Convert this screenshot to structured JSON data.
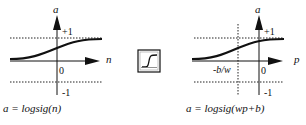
{
  "left_plot": {
    "y_label": "a",
    "x_label": "n",
    "plus_one": "+1",
    "minus_one": "-1",
    "zero": "0",
    "formula": "a = logsig(n)"
  },
  "icon": {
    "name": "logsig-transfer-function-icon"
  },
  "right_plot": {
    "y_label": "a",
    "x_label": "p",
    "plus_one": "+1",
    "minus_one": "-1",
    "zero": "0",
    "offset_label": "-b/w",
    "formula": "a = logsig(wp+b)"
  },
  "colors": {
    "ink": "#111111",
    "background": "#ffffff"
  }
}
